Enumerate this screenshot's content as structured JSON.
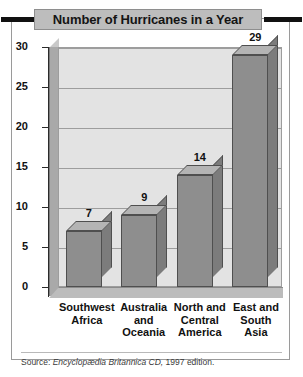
{
  "figure": {
    "title": "Number of Hurricanes in a Year",
    "source_prefix": "Source:",
    "source_italic": "Encyclopædia Britannica CD,",
    "source_suffix": "1997 edition."
  },
  "chart_data": {
    "type": "bar",
    "title": "Number of Hurricanes in a Year",
    "xlabel": "",
    "ylabel": "",
    "categories": [
      "Southwest Africa",
      "Australia and Oceania",
      "North and Central America",
      "East and South Asia"
    ],
    "category_lines": [
      [
        "Southwest",
        "Africa"
      ],
      [
        "Australia",
        "and",
        "Oceania"
      ],
      [
        "North and",
        "Central",
        "America"
      ],
      [
        "East and",
        "South Asia"
      ]
    ],
    "values": [
      7,
      9,
      14,
      29
    ],
    "value_labels": [
      "7",
      "9",
      "14",
      "29"
    ],
    "ylim": [
      0,
      30
    ],
    "yticks": [
      30,
      25,
      20,
      15,
      10,
      5,
      0
    ],
    "ytick_labels": [
      "30",
      "25",
      "20",
      "15",
      "10",
      "5",
      "0"
    ],
    "grid": true,
    "legend": "none",
    "style": "3d-bar",
    "colors": {
      "bar_front": "#8e8e8e",
      "bar_top": "#b4b4b4",
      "bar_side": "#7c7c7c",
      "bar_outline": "#4f4f4f",
      "plot_background": "#e3e3e3",
      "gridline": "#9d9d9d",
      "wall": "#a9a9a9",
      "floor": "#bcbcbc",
      "title_background": "#bdbdbd",
      "title_rule": "#111111",
      "frame": "#9a9a9a",
      "text": "#111111"
    }
  }
}
